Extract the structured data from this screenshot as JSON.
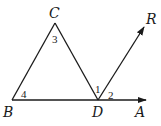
{
  "diagram": {
    "points": {
      "B": {
        "label": "B",
        "x": 12,
        "y": 100
      },
      "C": {
        "label": "C",
        "x": 55,
        "y": 23
      },
      "D": {
        "label": "D",
        "x": 98,
        "y": 100
      },
      "A": {
        "label": "A",
        "x": 146,
        "y": 100
      },
      "R": {
        "label": "R",
        "x": 144,
        "y": 27
      }
    },
    "segments": [
      "BC",
      "CD",
      "BD"
    ],
    "rays": [
      "DA",
      "DR"
    ],
    "angles": [
      {
        "label": "1",
        "vertex": "D",
        "between": [
          "C",
          "R"
        ]
      },
      {
        "label": "2",
        "vertex": "D",
        "between": [
          "R",
          "A"
        ]
      },
      {
        "label": "3",
        "vertex": "C",
        "between": [
          "B",
          "D"
        ]
      },
      {
        "label": "4",
        "vertex": "B",
        "between": [
          "C",
          "D"
        ]
      }
    ],
    "colors": {
      "stroke": "#1a1a1a",
      "background": "#ffffff"
    }
  }
}
